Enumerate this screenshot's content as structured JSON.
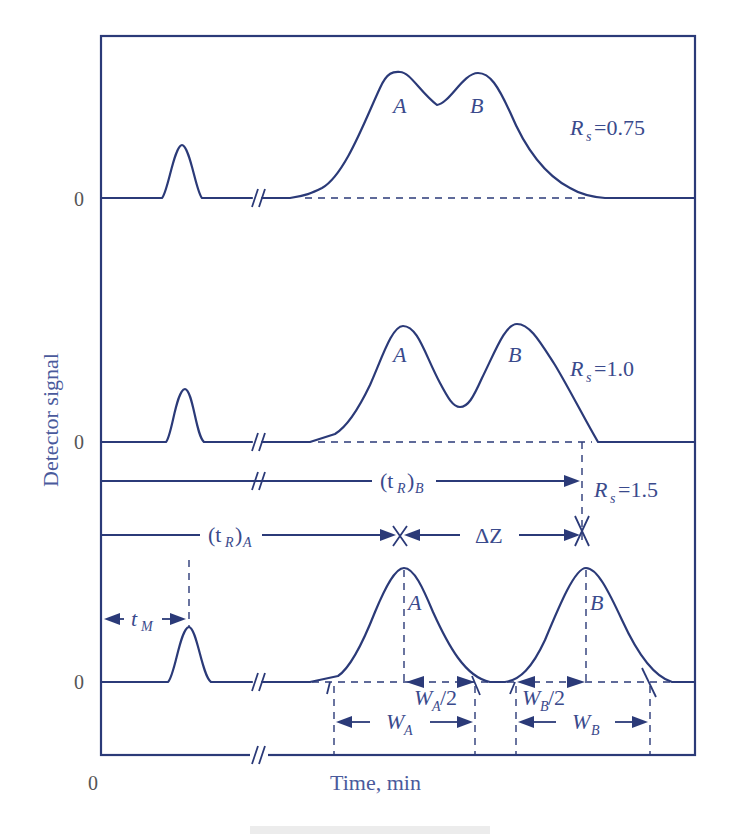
{
  "figure": {
    "y_axis_label": "Detector signal",
    "x_axis_label": "Time, min",
    "origin_label": "0",
    "baseline_labels": [
      "0",
      "0",
      "0"
    ],
    "caption": ""
  },
  "panels": [
    {
      "name": "top",
      "resolution_label": "R",
      "resolution_sub": "s",
      "resolution_value": "=0.75",
      "peak_a_label": "A",
      "peak_b_label": "B"
    },
    {
      "name": "middle",
      "resolution_label": "R",
      "resolution_sub": "s",
      "resolution_value": "=1.0",
      "peak_a_label": "A",
      "peak_b_label": "B"
    },
    {
      "name": "bottom",
      "resolution_label": "R",
      "resolution_sub": "s",
      "resolution_value": "=1.5",
      "peak_a_label": "A",
      "peak_b_label": "B"
    }
  ],
  "annotations": {
    "tr_b": {
      "base": "(t",
      "sub": "R",
      "close": ")",
      "sub2": "B"
    },
    "tr_a": {
      "base": "(t",
      "sub": "R",
      "close": ")",
      "sub2": "A"
    },
    "delta_z": "ΔZ",
    "t_m": {
      "base": "t",
      "sub": "M"
    },
    "wa_half": {
      "base": "W",
      "sub": "A",
      "suffix": "/2"
    },
    "wb_half": {
      "base": "W",
      "sub": "B",
      "suffix": "/2"
    },
    "wa": {
      "base": "W",
      "sub": "A"
    },
    "wb": {
      "base": "W",
      "sub": "B"
    }
  },
  "colors": {
    "stroke": "#2b3a78",
    "text": "#3a4a8c"
  }
}
